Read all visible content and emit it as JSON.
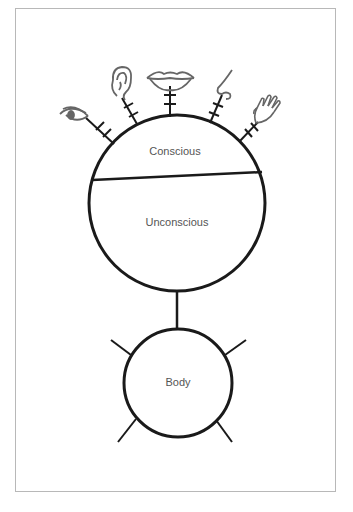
{
  "diagram": {
    "mind": {
      "top_label": "Conscious",
      "bottom_label": "Unconscious"
    },
    "body": {
      "label": "Body"
    },
    "senses": [
      {
        "name": "eye"
      },
      {
        "name": "ear"
      },
      {
        "name": "mouth"
      },
      {
        "name": "nose"
      },
      {
        "name": "hand"
      }
    ],
    "colors": {
      "stroke": "#1a1a1a",
      "label": "#555555",
      "icon": "#666666",
      "frame": "#b8b8b8"
    }
  }
}
